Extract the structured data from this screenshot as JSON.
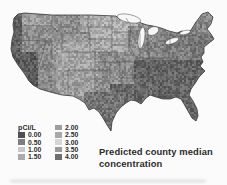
{
  "figure": {
    "title_line1": "Predicted county median",
    "title_line2": "concentration"
  },
  "legend": {
    "unit_label": "pCi/L",
    "entries": [
      {
        "value": "0.00",
        "color": "#4f4f4f"
      },
      {
        "value": "0.50",
        "color": "#7e7e7e"
      },
      {
        "value": "1.00",
        "color": "#c8c8c8"
      },
      {
        "value": "1.50",
        "color": "#ababab"
      },
      {
        "value": "2.00",
        "color": "#9e9e9e"
      },
      {
        "value": "2.50",
        "color": "#a9a9a9"
      },
      {
        "value": "3.00",
        "color": "#d6d6d6"
      },
      {
        "value": "3.50",
        "color": "#9b9b9b"
      },
      {
        "value": "4.00",
        "color": "#6f6f6f"
      }
    ]
  },
  "map": {
    "outline_color": "#3a3a3a",
    "state_line_color": "#454545",
    "lake_color": "#f7f7f7",
    "base_gray": 142,
    "noise": 52,
    "regions": [
      {
        "name": "upper-midwest",
        "x": 80,
        "y": 13,
        "w": 58,
        "h": 38,
        "gray": 168
      },
      {
        "name": "dakotas-minnesota",
        "x": 93,
        "y": 13,
        "w": 38,
        "h": 24,
        "gray": 176
      },
      {
        "name": "great-basin",
        "x": 40,
        "y": 32,
        "w": 50,
        "h": 50,
        "gray": 150
      },
      {
        "name": "colorado-plateau",
        "x": 58,
        "y": 42,
        "w": 40,
        "h": 33,
        "gray": 166
      },
      {
        "name": "new-mexico",
        "x": 55,
        "y": 70,
        "w": 40,
        "h": 26,
        "gray": 158
      },
      {
        "name": "nevada",
        "x": 34,
        "y": 38,
        "w": 18,
        "h": 45,
        "gray": 138
      },
      {
        "name": "eastern-washington",
        "x": 20,
        "y": 13,
        "w": 34,
        "h": 14,
        "gray": 158
      },
      {
        "name": "midwest",
        "x": 128,
        "y": 26,
        "w": 50,
        "h": 42,
        "gray": 142
      },
      {
        "name": "tennessee-valley",
        "x": 146,
        "y": 40,
        "w": 30,
        "h": 22,
        "gray": 132
      },
      {
        "name": "appalachia",
        "x": 162,
        "y": 28,
        "w": 42,
        "h": 42,
        "gray": 128
      },
      {
        "name": "new-england",
        "x": 193,
        "y": 12,
        "w": 24,
        "h": 26,
        "gray": 136
      },
      {
        "name": "east-coast",
        "x": 190,
        "y": 34,
        "w": 26,
        "h": 38,
        "gray": 120
      },
      {
        "name": "southeast",
        "x": 134,
        "y": 60,
        "w": 75,
        "h": 68,
        "gray": 100
      },
      {
        "name": "gulf-coast",
        "x": 110,
        "y": 84,
        "w": 45,
        "h": 50,
        "gray": 106
      },
      {
        "name": "south-texas",
        "x": 84,
        "y": 92,
        "w": 40,
        "h": 45,
        "gray": 116
      },
      {
        "name": "florida",
        "x": 174,
        "y": 94,
        "w": 28,
        "h": 34,
        "gray": 104
      },
      {
        "name": "pacific-coast",
        "x": 8,
        "y": 12,
        "w": 14,
        "h": 55,
        "gray": 100
      },
      {
        "name": "california-coast",
        "x": 8,
        "y": 52,
        "w": 30,
        "h": 42,
        "gray": 92
      }
    ]
  },
  "chart_data": {
    "type": "heatmap",
    "subtype": "choropleth-us-counties",
    "title": "Predicted county median concentration",
    "unit": "pCi/L",
    "legend_values": [
      0.0,
      0.5,
      1.0,
      1.5,
      2.0,
      2.5,
      3.0,
      3.5,
      4.0
    ],
    "legend_colors": [
      "#4f4f4f",
      "#7e7e7e",
      "#c8c8c8",
      "#ababab",
      "#9e9e9e",
      "#a9a9a9",
      "#d6d6d6",
      "#9b9b9b",
      "#6f6f6f"
    ]
  }
}
